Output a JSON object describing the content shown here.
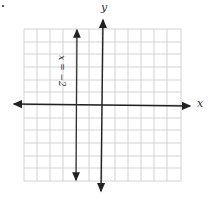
{
  "graph": {
    "x_axis_label": "x",
    "y_axis_label": "y",
    "line_label": "x = −2",
    "marker": ".",
    "grid": {
      "columns": 12,
      "rows": 12
    },
    "line": {
      "type": "vertical",
      "x": -2
    },
    "colors": {
      "grid": "#c8c8c8",
      "axis": "#222222",
      "line": "#333333"
    }
  }
}
